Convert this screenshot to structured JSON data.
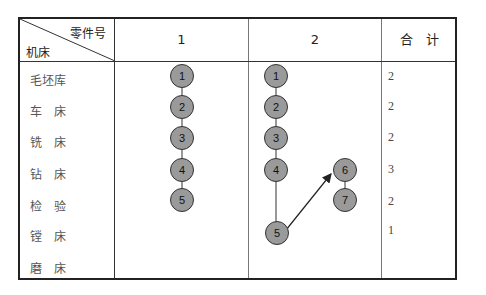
{
  "table": {
    "corner": {
      "top_right": "零件号",
      "bottom_left": "机床"
    },
    "columns": [
      "1",
      "2",
      "合　计"
    ],
    "rows": [
      {
        "machine": "毛坯库",
        "total": "2"
      },
      {
        "machine": "车　床",
        "total": "2"
      },
      {
        "machine": "铣　床",
        "total": "2"
      },
      {
        "machine": "钻　床",
        "total": "3"
      },
      {
        "machine": "检　验",
        "total": "2"
      },
      {
        "machine": "镗　床",
        "total": "1"
      },
      {
        "machine": "磨　床",
        "total": ""
      }
    ],
    "part1_nodes": [
      "1",
      "2",
      "3",
      "4",
      "5"
    ],
    "part2_nodes": [
      "1",
      "2",
      "3",
      "4",
      "5",
      "6",
      "7"
    ]
  },
  "colors": {
    "node_fill": "#9a9a9a",
    "node_stroke": "#333333",
    "border": "#222222"
  }
}
